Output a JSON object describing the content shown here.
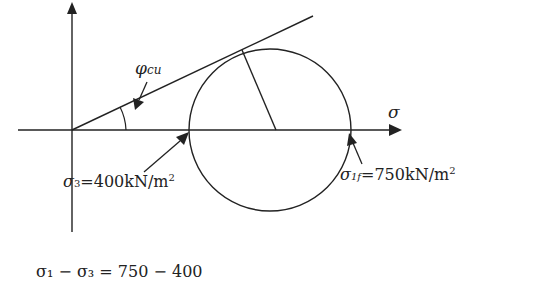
{
  "diagram": {
    "axis_x_label": "σ",
    "angle_label_main": "φ",
    "angle_label_sub": "cu",
    "sigma3_label_main": "σ",
    "sigma3_label_sub": "3",
    "sigma3_value": "=400kN/m",
    "sigma3_sup": "2",
    "sigma1_label_main": "σ",
    "sigma1_label_sub": "1f",
    "sigma1_value": "=750kN/m",
    "sigma1_sup": "2",
    "formula_partial": "σ₁ − σ₃ = 750 − 400"
  }
}
